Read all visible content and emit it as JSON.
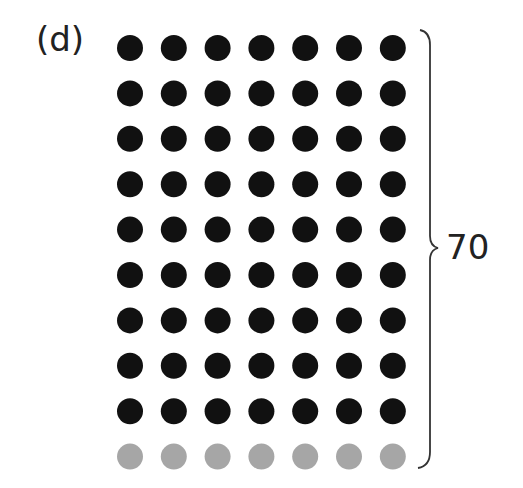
{
  "figure": {
    "label": "(d)",
    "total_label": "70",
    "grid": {
      "columns": 7,
      "rows": 10,
      "filled_rows": 9,
      "empty_rows": 1,
      "filled_color": "#111111",
      "empty_color": "#a6a6a6"
    },
    "brace": "right curly brace spanning all rows"
  }
}
